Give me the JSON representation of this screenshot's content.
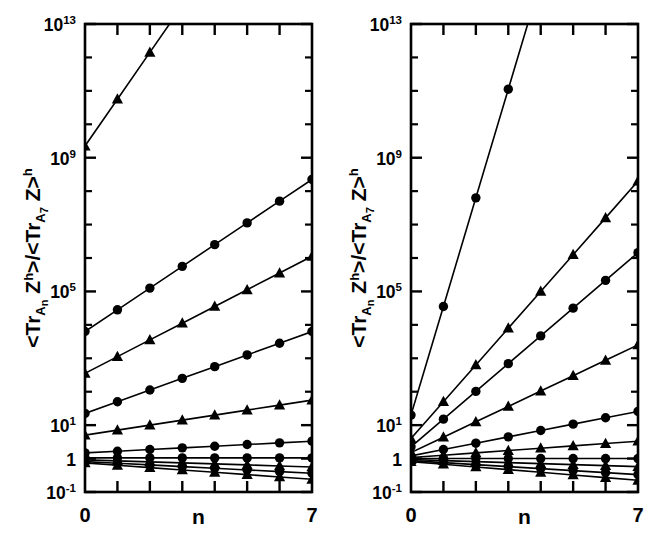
{
  "figure": {
    "caption_absent": true,
    "panel_count": 2,
    "marker_cycle": [
      "circle",
      "triangle"
    ],
    "line_color": "#000000",
    "background": "#ffffff"
  },
  "axes": {
    "y_label_plain": "<Tr_An Z^h>/<Tr_A7 Z>^h",
    "y_label_parts": {
      "open_angle": "<",
      "tr": "Tr",
      "sub_an": "A",
      "sub_an_idx": "n",
      "z": "Z",
      "sup_h": "h",
      "close_angle": ">",
      "slash": "/",
      "open_angle2": "<",
      "tr2": "Tr",
      "sub_a7": "A",
      "sub_a7_idx": "7",
      "z2": "Z",
      "close_angle2": ">",
      "sup_h2": "h"
    },
    "x_label": "n",
    "x_ticklabels": [
      "0",
      "7"
    ],
    "x_min": 0,
    "x_max": 7,
    "x_tick_values": [
      0,
      1,
      2,
      3,
      4,
      5,
      6,
      7
    ],
    "y_scale": "log",
    "y_min_exp": -1,
    "y_max_exp": 13,
    "y_ticklabels": [
      {
        "text": "10",
        "sup": "13",
        "exp": 13
      },
      {
        "text": "10",
        "sup": "9",
        "exp": 9
      },
      {
        "text": "10",
        "sup": "5",
        "exp": 5
      },
      {
        "text": "10",
        "sup": "1",
        "exp": 1
      },
      {
        "text": "1",
        "sup": "",
        "exp": 0
      },
      {
        "text": "10",
        "sup": "-1",
        "exp": -1
      }
    ],
    "y_minor_tick_exps": [
      12,
      11,
      10,
      8,
      7,
      6,
      4,
      3,
      2
    ]
  },
  "chart_data": [
    {
      "panel": "left",
      "type": "line",
      "title": "",
      "xlabel": "n",
      "ylabel": "<Tr_An Z^h>/<Tr_A7 Z>^h",
      "xlim": [
        0,
        7
      ],
      "ylim_exp": [
        -1,
        13
      ],
      "grid": false,
      "legend": "none",
      "x": [
        0,
        1,
        2,
        3,
        4,
        5,
        6,
        7
      ],
      "series": [
        {
          "name": "s1",
          "marker": "triangle",
          "log10_values": [
            9.35,
            10.75,
            12.15,
            13.55,
            14.95,
            16.35,
            17.75,
            19.15
          ]
        },
        {
          "name": "s2",
          "marker": "circle",
          "log10_values": [
            3.8,
            4.45,
            5.1,
            5.75,
            6.4,
            7.05,
            7.7,
            8.35
          ]
        },
        {
          "name": "s3",
          "marker": "triangle",
          "log10_values": [
            2.55,
            3.05,
            3.55,
            4.05,
            4.55,
            5.05,
            5.55,
            6.05
          ]
        },
        {
          "name": "s4",
          "marker": "circle",
          "log10_values": [
            1.35,
            1.7,
            2.05,
            2.4,
            2.75,
            3.1,
            3.45,
            3.8
          ]
        },
        {
          "name": "s5",
          "marker": "triangle",
          "log10_values": [
            0.7,
            0.85,
            1.0,
            1.15,
            1.3,
            1.45,
            1.6,
            1.75
          ]
        },
        {
          "name": "s6",
          "marker": "circle",
          "log10_values": [
            0.17,
            0.22,
            0.27,
            0.32,
            0.37,
            0.42,
            0.47,
            0.52
          ]
        },
        {
          "name": "s7",
          "marker": "circle",
          "log10_values": [
            0.02,
            0.02,
            0.02,
            0.02,
            0.02,
            0.02,
            0.02,
            0.02
          ]
        },
        {
          "name": "s8",
          "marker": "triangle",
          "log10_values": [
            -0.04,
            -0.07,
            -0.1,
            -0.13,
            -0.16,
            -0.19,
            -0.22,
            -0.25
          ]
        },
        {
          "name": "s9",
          "marker": "circle",
          "log10_values": [
            -0.09,
            -0.14,
            -0.19,
            -0.24,
            -0.29,
            -0.34,
            -0.39,
            -0.44
          ]
        },
        {
          "name": "s10",
          "marker": "triangle",
          "log10_values": [
            -0.13,
            -0.2,
            -0.27,
            -0.34,
            -0.41,
            -0.48,
            -0.55,
            -0.62
          ]
        }
      ]
    },
    {
      "panel": "right",
      "type": "line",
      "title": "",
      "xlabel": "n",
      "ylabel": "<Tr_An Z^h>/<Tr_A7 Z>^h",
      "xlim": [
        0,
        7
      ],
      "ylim_exp": [
        -1,
        13
      ],
      "grid": false,
      "legend": "none",
      "x": [
        0,
        1,
        2,
        3,
        4,
        5,
        6,
        7
      ],
      "series": [
        {
          "name": "r1",
          "marker": "circle",
          "log10_values": [
            1.3,
            4.55,
            7.8,
            11.05,
            14.3,
            17.55,
            20.8,
            24.05
          ]
        },
        {
          "name": "r2",
          "marker": "triangle",
          "log10_values": [
            0.6,
            1.7,
            2.8,
            3.9,
            5.0,
            6.1,
            7.2,
            8.3
          ]
        },
        {
          "name": "r3",
          "marker": "circle",
          "log10_values": [
            0.35,
            1.18,
            2.01,
            2.84,
            3.67,
            4.5,
            5.33,
            6.16
          ]
        },
        {
          "name": "r4",
          "marker": "triangle",
          "log10_values": [
            0.18,
            0.64,
            1.1,
            1.56,
            2.02,
            2.48,
            2.94,
            3.4
          ]
        },
        {
          "name": "r5",
          "marker": "circle",
          "log10_values": [
            0.08,
            0.27,
            0.46,
            0.65,
            0.84,
            1.03,
            1.22,
            1.41
          ]
        },
        {
          "name": "r6",
          "marker": "triangle",
          "log10_values": [
            0.03,
            0.1,
            0.17,
            0.24,
            0.31,
            0.38,
            0.45,
            0.52
          ]
        },
        {
          "name": "r7",
          "marker": "circle",
          "log10_values": [
            0.0,
            0.0,
            0.0,
            0.0,
            0.0,
            0.0,
            0.0,
            0.0
          ]
        },
        {
          "name": "r8",
          "marker": "triangle",
          "log10_values": [
            -0.03,
            -0.06,
            -0.09,
            -0.12,
            -0.15,
            -0.18,
            -0.21,
            -0.24
          ]
        },
        {
          "name": "r9",
          "marker": "circle",
          "log10_values": [
            -0.06,
            -0.12,
            -0.18,
            -0.24,
            -0.3,
            -0.36,
            -0.42,
            -0.48
          ]
        },
        {
          "name": "r10",
          "marker": "triangle",
          "log10_values": [
            -0.09,
            -0.17,
            -0.25,
            -0.33,
            -0.41,
            -0.49,
            -0.57,
            -0.65
          ]
        }
      ]
    }
  ]
}
